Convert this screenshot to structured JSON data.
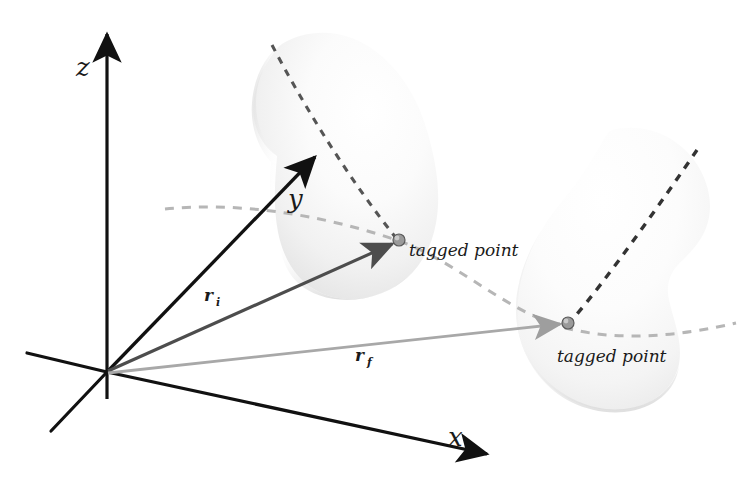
{
  "figure": {
    "background_color": "#ffffff",
    "axes": {
      "z": {
        "label": "z",
        "color": "#111111"
      },
      "y": {
        "label": "y",
        "color": "#111111"
      },
      "x": {
        "label": "x",
        "color": "#111111"
      }
    },
    "vectors": [
      {
        "name": "r_i",
        "label": "r",
        "subscript": "i",
        "color": "#4d4d4d"
      },
      {
        "name": "r_f",
        "label": "r",
        "subscript": "f",
        "color": "#a8a8a8"
      }
    ],
    "bodies": [
      {
        "name": "initial-configuration",
        "fill_light": "#ffffff",
        "fill_mid": "#f4f4f4",
        "fill_shadow": "#dcdcdc",
        "point_label": "tagged point"
      },
      {
        "name": "final-configuration",
        "fill_light": "#ffffff",
        "fill_mid": "#f6f6f6",
        "fill_shadow": "#e2e2e2",
        "point_label": "tagged point"
      }
    ],
    "trajectory": {
      "name": "tagged-point-path",
      "style": "dashed",
      "color": "#b4b4b4"
    },
    "internal_dashes": {
      "color": "#555555",
      "style": "dashed"
    },
    "tagged_point_marker": {
      "fill": "#9a9a9a",
      "stroke": "#555555"
    }
  }
}
